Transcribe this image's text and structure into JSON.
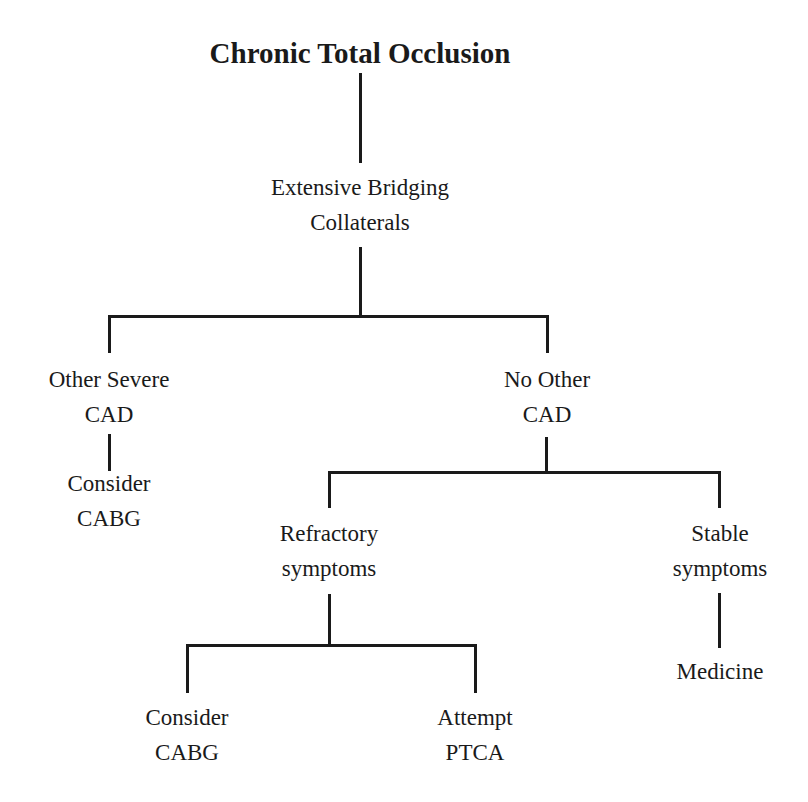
{
  "diagram": {
    "type": "decision-tree",
    "title": "Chronic Total Occlusion",
    "nodes": {
      "root": {
        "lines": [
          "Chronic Total Occlusion"
        ]
      },
      "collaterals": {
        "lines": [
          "Extensive Bridging",
          "Collaterals"
        ]
      },
      "other_cad": {
        "lines": [
          "Other Severe",
          "CAD"
        ]
      },
      "consider_cabg_1": {
        "lines": [
          "Consider",
          "CABG"
        ]
      },
      "no_other_cad": {
        "lines": [
          "No Other",
          "CAD"
        ]
      },
      "refractory": {
        "lines": [
          "Refractory",
          "symptoms"
        ]
      },
      "stable": {
        "lines": [
          "Stable",
          "symptoms"
        ]
      },
      "medicine": {
        "lines": [
          "Medicine"
        ]
      },
      "consider_cabg_2": {
        "lines": [
          "Consider",
          "CABG"
        ]
      },
      "attempt_ptca": {
        "lines": [
          "Attempt",
          "PTCA"
        ]
      }
    },
    "edges": [
      [
        "root",
        "collaterals"
      ],
      [
        "collaterals",
        "other_cad"
      ],
      [
        "collaterals",
        "no_other_cad"
      ],
      [
        "other_cad",
        "consider_cabg_1"
      ],
      [
        "no_other_cad",
        "refractory"
      ],
      [
        "no_other_cad",
        "stable"
      ],
      [
        "stable",
        "medicine"
      ],
      [
        "refractory",
        "consider_cabg_2"
      ],
      [
        "refractory",
        "attempt_ptca"
      ]
    ]
  }
}
